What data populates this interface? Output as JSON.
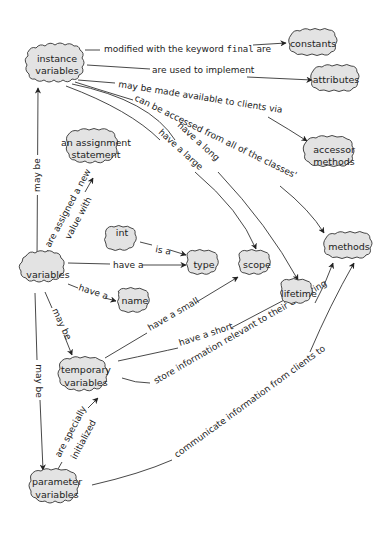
{
  "diagram": {
    "type": "concept-map",
    "nodes": {
      "instance_variables": {
        "line1": "instance",
        "line2": "variables"
      },
      "constants": {
        "label": "constants"
      },
      "attributes": {
        "label": "attributes"
      },
      "accessor_methods": {
        "line1": "accessor",
        "line2": "methods"
      },
      "assignment_statement": {
        "line1": "an assignment",
        "line2": "statement"
      },
      "int": {
        "label": "int"
      },
      "variables": {
        "label": "variables"
      },
      "type": {
        "label": "type"
      },
      "scope": {
        "label": "scope"
      },
      "methods": {
        "label": "methods"
      },
      "lifetime": {
        "label": "lifetime"
      },
      "name": {
        "label": "name"
      },
      "temporary_variables": {
        "line1": "temporary",
        "line2": "variables"
      },
      "parameter_variables": {
        "line1": "parameter",
        "line2": "variables"
      }
    },
    "edges": {
      "final_prefix": "modified with the keyword ",
      "final_keyword": "final",
      "final_suffix": " are",
      "used_to_implement": "are used to implement",
      "made_available": "may be made available to clients via",
      "accessed_from_all": "can be accessed from all of the classes'",
      "have_a_long": "have a long",
      "have_a_large": "have a large",
      "may_be_instance": "may be",
      "assigned_new_line1": "are assigned a new",
      "assigned_new_line2": "value with",
      "is_a": "is a",
      "have_a_type": "have a",
      "have_a_name": "have a",
      "may_be_temporary": "may be",
      "may_be_parameter": "may be",
      "have_a_small": "have a small",
      "have_a_short": "have a short",
      "store_information": "store information relevant to their declaring",
      "specially_line1": "are specially",
      "specially_line2": "initialized",
      "communicate": "communicate information from clients to"
    }
  }
}
